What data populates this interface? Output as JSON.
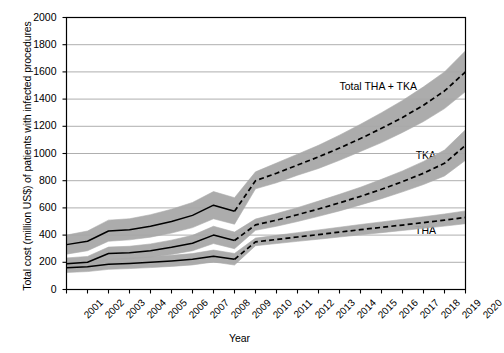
{
  "chart_data": {
    "type": "line",
    "title": "",
    "xlabel": "Year",
    "ylabel": "Total cost (million US$) of patients with infected procedures",
    "x": [
      2001,
      2002,
      2003,
      2004,
      2005,
      2006,
      2007,
      2008,
      2009,
      2010,
      2011,
      2012,
      2013,
      2014,
      2015,
      2016,
      2017,
      2018,
      2019,
      2020
    ],
    "xlim": [
      2001,
      2020
    ],
    "ylim": [
      0,
      2000
    ],
    "yticks": [
      0,
      200,
      400,
      600,
      800,
      1000,
      1200,
      1400,
      1600,
      1800,
      2000
    ],
    "xticks": [
      "2001",
      "2002",
      "2003",
      "2004",
      "2005",
      "2006",
      "2007",
      "2008",
      "2009",
      "2010",
      "2011",
      "2012",
      "2013",
      "2014",
      "2015",
      "2016",
      "2017",
      "2018",
      "2019",
      "2020"
    ],
    "grid": true,
    "legend_position": "inline-annotations",
    "historical_years": [
      2001,
      2002,
      2003,
      2004,
      2005,
      2006,
      2007,
      2008,
      2009
    ],
    "projected_years": [
      2010,
      2011,
      2012,
      2013,
      2014,
      2015,
      2016,
      2017,
      2018,
      2019,
      2020
    ],
    "band_color": "#a8a8a8",
    "line_color": "#000000",
    "series": [
      {
        "name": "Total THA + TKA",
        "label": "Total THA + TKA",
        "label_x": 2014.0,
        "label_y": 1490,
        "values": [
          330,
          355,
          430,
          440,
          465,
          500,
          545,
          620,
          575,
          800,
          855,
          915,
          975,
          1040,
          1110,
          1185,
          1265,
          1355,
          1460,
          1600
        ],
        "lower": [
          260,
          285,
          355,
          365,
          385,
          415,
          455,
          520,
          480,
          740,
          785,
          840,
          890,
          950,
          1015,
          1080,
          1155,
          1235,
          1330,
          1455
        ],
        "upper": [
          400,
          430,
          510,
          520,
          550,
          590,
          640,
          720,
          675,
          865,
          930,
          995,
          1060,
          1135,
          1215,
          1300,
          1390,
          1490,
          1600,
          1755
        ]
      },
      {
        "name": "TKA",
        "label": "TKA",
        "label_x": 2018.6,
        "label_y": 980,
        "values": [
          190,
          200,
          265,
          270,
          285,
          310,
          340,
          400,
          360,
          475,
          510,
          550,
          592,
          637,
          685,
          737,
          793,
          855,
          928,
          1060
        ],
        "lower": [
          150,
          160,
          220,
          225,
          238,
          258,
          285,
          338,
          300,
          435,
          465,
          500,
          538,
          578,
          622,
          668,
          718,
          772,
          835,
          950
        ],
        "upper": [
          232,
          243,
          312,
          318,
          335,
          363,
          398,
          465,
          422,
          518,
          558,
          602,
          650,
          700,
          752,
          810,
          872,
          942,
          1025,
          1175
        ]
      },
      {
        "name": "THA",
        "label": "THA",
        "label_x": 2018.6,
        "label_y": 430,
        "values": [
          160,
          168,
          185,
          192,
          200,
          210,
          222,
          245,
          222,
          350,
          368,
          386,
          404,
          422,
          440,
          457,
          474,
          492,
          510,
          530
        ],
        "lower": [
          125,
          132,
          148,
          154,
          161,
          170,
          181,
          202,
          180,
          322,
          338,
          354,
          370,
          386,
          402,
          418,
          434,
          450,
          466,
          484
        ],
        "upper": [
          196,
          205,
          223,
          231,
          240,
          251,
          264,
          290,
          265,
          378,
          398,
          418,
          438,
          458,
          478,
          497,
          516,
          535,
          555,
          578
        ]
      }
    ]
  }
}
